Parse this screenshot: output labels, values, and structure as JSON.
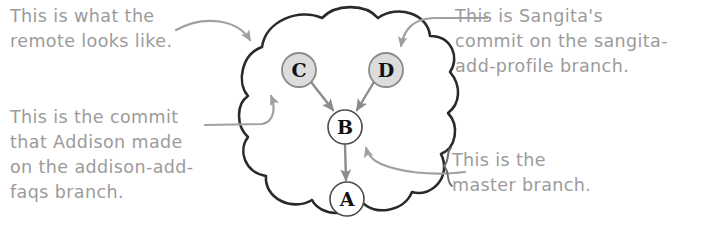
{
  "diagram": {
    "annotations": [
      {
        "id": "note-remote",
        "text": "This is what the\nremote looks like.",
        "position": "top-left",
        "points_to": "remote-cloud"
      },
      {
        "id": "note-addison",
        "text": "This is the commit\nthat Addison made\non the addison-add-\nfaqs branch.",
        "position": "bottom-left",
        "points_to": "commit-node-c"
      },
      {
        "id": "note-sangita",
        "text": "This is Sangita's\ncommit on the sangita-\nadd-profile branch.",
        "position": "top-right",
        "points_to": "commit-node-d"
      },
      {
        "id": "note-master",
        "text": "This is the\nmaster branch.",
        "position": "bottom-right",
        "points_to": "commit-node-b"
      }
    ],
    "cloud": {
      "label": "remote-cloud",
      "stroke_color": "#2a2a2a",
      "fill_color": "#ffffff"
    },
    "commits": [
      {
        "id": "A",
        "label": "A",
        "cx": 347,
        "cy": 199,
        "r": 17,
        "fill": "#ffffff",
        "stroke": "#444444"
      },
      {
        "id": "B",
        "label": "B",
        "cx": 345,
        "cy": 127,
        "r": 17,
        "fill": "#ffffff",
        "stroke": "#444444"
      },
      {
        "id": "C",
        "label": "C",
        "cx": 299,
        "cy": 70,
        "r": 17,
        "fill": "#dcdcdc",
        "stroke": "#8a8a8a"
      },
      {
        "id": "D",
        "label": "D",
        "cx": 386,
        "cy": 70,
        "r": 17,
        "fill": "#dcdcdc",
        "stroke": "#8a8a8a"
      }
    ],
    "edges": [
      {
        "from": "C",
        "to": "B",
        "color": "#8c8c8c"
      },
      {
        "from": "D",
        "to": "B",
        "color": "#8c8c8c"
      },
      {
        "from": "B",
        "to": "A",
        "color": "#8c8c8c"
      }
    ],
    "colors": {
      "handwriting": "#9b9b9b",
      "cloud_outline": "#2a2a2a",
      "arrow": "#9b9b9b",
      "node_text": "#121212"
    }
  }
}
